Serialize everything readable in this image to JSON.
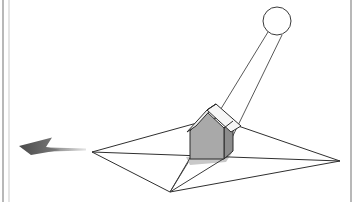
{
  "figure": {
    "background_color": "#ffffff",
    "width": 360,
    "height": 202,
    "frame": {
      "left_border_x": 3,
      "left_border_inner_x": 9,
      "right_border_x": 351,
      "border_color": "#9a9a9a",
      "border_color_light": "#c9c9c9"
    }
  },
  "scene": {
    "sun": {
      "label": "sun",
      "cx": 277,
      "cy": 21,
      "r": 14,
      "stroke": "#3a3a3a",
      "fill": "#ffffff",
      "stroke_width": 1
    },
    "light_rays": [
      {
        "name": "ray-left",
        "from": [
          268,
          32
        ],
        "to": [
          170,
          192
        ],
        "stroke": "#555555"
      },
      {
        "name": "ray-right",
        "from": [
          282,
          35
        ],
        "to": [
          226,
          150
        ],
        "stroke": "#555555"
      }
    ],
    "ground_plane": {
      "label": "ground plane",
      "points": "92,152 215,118 340,161 170,192",
      "stroke": "#2f2f2f",
      "fill": "none",
      "stroke_width": 1,
      "left_vertex": [
        92,
        152
      ],
      "top_vertex": [
        215,
        118
      ],
      "right_vertex": [
        340,
        161
      ],
      "bottom_vertex": [
        170,
        192
      ]
    },
    "horizon_line": {
      "name": "horizon-line",
      "from": [
        92,
        152
      ],
      "to": [
        340,
        161
      ],
      "stroke": "#2f2f2f"
    },
    "shadow": {
      "label": "cast shadow",
      "points": "189,158 226,152 170,192",
      "stroke": "#3a3a3a",
      "fill": "none"
    },
    "shadow_patch": {
      "name": "shadow-patch",
      "points": "186,157 232,153 226,162 190,165",
      "fill": "#c8c8c8"
    },
    "house": {
      "label": "house",
      "front_wall": {
        "name": "house-front-wall",
        "points": "190,131 207,112 224,128 224,158 190,158",
        "fill": "#a9a9a9",
        "stroke": "#2b2b2b"
      },
      "side_wall": {
        "name": "house-side-wall",
        "points": "224,128 232,122 232,152 224,158",
        "fill": "#8c8c8c",
        "stroke": "#2b2b2b"
      },
      "roof_front_slope": {
        "name": "house-roof-front-slope",
        "points": "207,110 216,104 240,126 230,131",
        "fill": "#f4f4f4",
        "stroke": "#2b2b2b"
      },
      "roof_back_slope": {
        "name": "house-roof-back-slope",
        "points": "188,130 197,124 216,104 207,110",
        "fill": "#ededed",
        "stroke": "#2b2b2b"
      },
      "ridge": {
        "name": "house-roof-ridge",
        "from": [
          207,
          110
        ],
        "to": [
          216,
          104
        ]
      },
      "eave_right": {
        "name": "house-eave-right",
        "from": [
          224,
          128
        ],
        "to": [
          232,
          122
        ]
      }
    },
    "direction_arrow": {
      "label": "direction arrow",
      "tip": [
        19,
        146
      ],
      "tail_end": [
        86,
        149
      ],
      "head_points": "19,146 48,138 44,147 56,150 30,154",
      "fill_dark": "#4f4f4f",
      "fill_light": "#d6d6d6",
      "gradient_id": "arrow-fade"
    }
  }
}
